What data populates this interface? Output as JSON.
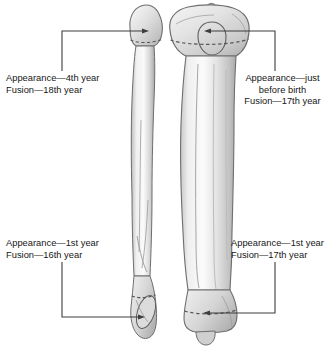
{
  "figure": {
    "background_color": "#ffffff",
    "line_color": "#4a4a4a",
    "bone_fill_light": "#f2f2f2",
    "bone_fill_mid": "#d8d8d8",
    "bone_fill_dark": "#bdbdbd",
    "bone_outline": "#6e6e6e",
    "dashed_line_color": "#555555"
  },
  "labels": {
    "top_left": {
      "name": "fibula-proximal-epiphysis-label",
      "line1": "Appearance—4th year",
      "line2": "Fusion—18th year",
      "text": "Appearance—4th year\nFusion—18th year",
      "align": "left"
    },
    "bottom_left": {
      "name": "fibula-distal-epiphysis-label",
      "line1": "Appearance—1st year",
      "line2": "Fusion—16th year",
      "text": "Appearance—1st year\nFusion—16th year",
      "align": "left"
    },
    "top_right": {
      "name": "tibia-proximal-epiphysis-label",
      "line1": "Appearance—just",
      "line2": "before birth",
      "line3": "Fusion—17th year",
      "text": "Appearance—just\nbefore birth\nFusion—17th year",
      "align": "center"
    },
    "bottom_right": {
      "name": "tibia-distal-epiphysis-label",
      "line1": "Appearance—1st year",
      "line2": "Fusion—17th year",
      "text": "Appearance—1st year\nFusion—17th year",
      "align": "left"
    }
  },
  "bones": [
    {
      "name": "fibula",
      "side": "left",
      "label_refs": [
        "top_left",
        "bottom_left"
      ]
    },
    {
      "name": "tibia",
      "side": "right",
      "label_refs": [
        "top_right",
        "bottom_right"
      ]
    }
  ],
  "leaders": [
    {
      "name": "leader-top-left",
      "from": "fibula-head",
      "to": "top_left"
    },
    {
      "name": "leader-bottom-left",
      "from": "lateral-malleolus",
      "to": "bottom_left"
    },
    {
      "name": "leader-top-right",
      "from": "tibial-plateau",
      "to": "top_right"
    },
    {
      "name": "leader-bottom-right",
      "from": "distal-tibia",
      "to": "bottom_right"
    }
  ]
}
